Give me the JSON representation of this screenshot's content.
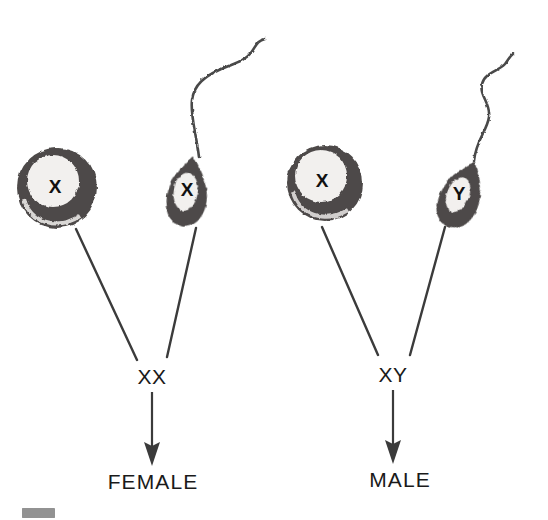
{
  "figure": {
    "background_color": "#ffffff",
    "ink_color": "#3b3b3b",
    "cell_fill_color": "#4d4a48",
    "nucleus_color": "#f2f0ee",
    "width": 548,
    "height": 520
  },
  "crosses": [
    {
      "id": "female-cross",
      "egg": {
        "name": "egg-cell",
        "chromosome": "X",
        "cx": 57,
        "cy": 188,
        "r": 40
      },
      "sperm": {
        "name": "sperm-cell",
        "chromosome": "X",
        "cx": 188,
        "cy": 190
      },
      "genotype": "XX",
      "outcome": "FEMALE"
    },
    {
      "id": "male-cross",
      "egg": {
        "name": "egg-cell",
        "chromosome": "X",
        "cx": 325,
        "cy": 183,
        "r": 38
      },
      "sperm": {
        "name": "sperm-cell",
        "chromosome": "Y",
        "cx": 462,
        "cy": 193
      },
      "genotype": "XY",
      "outcome": "MALE"
    }
  ],
  "icons": {
    "egg": "egg-cell-icon",
    "sperm": "sperm-cell-icon",
    "arrow": "down-arrow-icon",
    "artifact": "scan-smudge-artifact"
  }
}
